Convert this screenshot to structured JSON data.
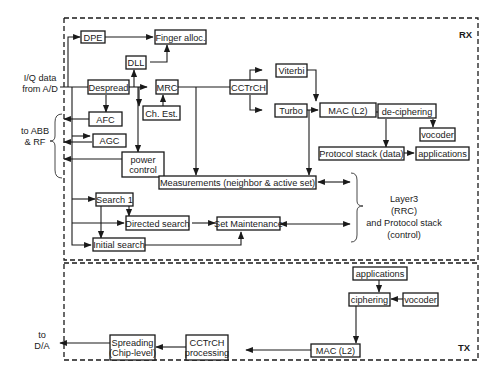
{
  "diagram": {
    "type": "block-diagram",
    "sections": {
      "rx": {
        "label": "RX"
      },
      "tx": {
        "label": "TX"
      }
    },
    "external_labels": {
      "iq_input": [
        "I/Q data",
        "from A/D"
      ],
      "abb_rf": [
        "to ABB",
        "& RF"
      ],
      "layer3": [
        "Layer3",
        "(RRC)",
        "and Protocol stack",
        "(control)"
      ],
      "da_output": [
        "to",
        "D/A"
      ]
    },
    "rx_blocks": {
      "dpe": "DPE",
      "finger_alloc": "Finger alloc.",
      "dll": "DLL",
      "despread": "Despread",
      "mrc": "MRC",
      "ch_est": "Ch. Est.",
      "cctrch": "CCTrCH",
      "viterbi": "Viterbi",
      "turbo": "Turbo",
      "mac": "MAC (L2)",
      "deciphering": "de-ciphering",
      "vocoder": "vocoder",
      "protocol_stack_data": "Protocol stack (data)",
      "applications": "applications",
      "afc": "AFC",
      "agc": "AGC",
      "power_control": [
        "power",
        "control"
      ],
      "measurements": "Measurements (neighbor & active set)",
      "search1": "Search 1",
      "directed_search": "Directed search",
      "set_maintenance": "Set Maintenance",
      "initial_search": "Initial search"
    },
    "tx_blocks": {
      "applications": "applications",
      "ciphering": "ciphering",
      "vocoder": "vocoder",
      "mac": "MAC (L2)",
      "cctrch_processing": [
        "CCTrCH",
        "processing"
      ],
      "spreading": [
        "Spreading",
        "(Chip-level)"
      ]
    }
  }
}
